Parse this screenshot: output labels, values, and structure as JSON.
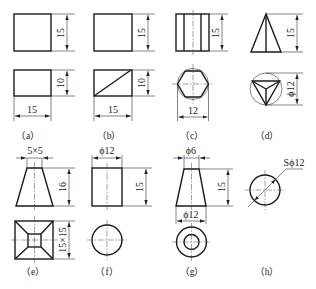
{
  "figure": {
    "panels": [
      {
        "id": "a",
        "label": "（a）",
        "dims": {
          "height_top": "15",
          "height_bottom": "10",
          "width": "15"
        }
      },
      {
        "id": "b",
        "label": "（b）",
        "dims": {
          "height_top": "15",
          "height_bottom": "10",
          "width": "15"
        }
      },
      {
        "id": "c",
        "label": "（c）",
        "dims": {
          "height": "15",
          "width": "12"
        }
      },
      {
        "id": "d",
        "label": "（d）",
        "dims": {
          "height": "15",
          "diameter": "ϕ12"
        }
      },
      {
        "id": "e",
        "label": "（e）",
        "dims": {
          "top": "5×5",
          "height": "16",
          "base": "15×15"
        }
      },
      {
        "id": "f",
        "label": "（f）",
        "dims": {
          "diameter": "ϕ12",
          "height": "15"
        }
      },
      {
        "id": "g",
        "label": "（g）",
        "dims": {
          "top_diameter": "ϕ6",
          "height": "15",
          "bottom_diameter": "ϕ12"
        }
      },
      {
        "id": "h",
        "label": "（h）",
        "dims": {
          "sphere_diameter": "Sϕ12"
        }
      }
    ]
  }
}
